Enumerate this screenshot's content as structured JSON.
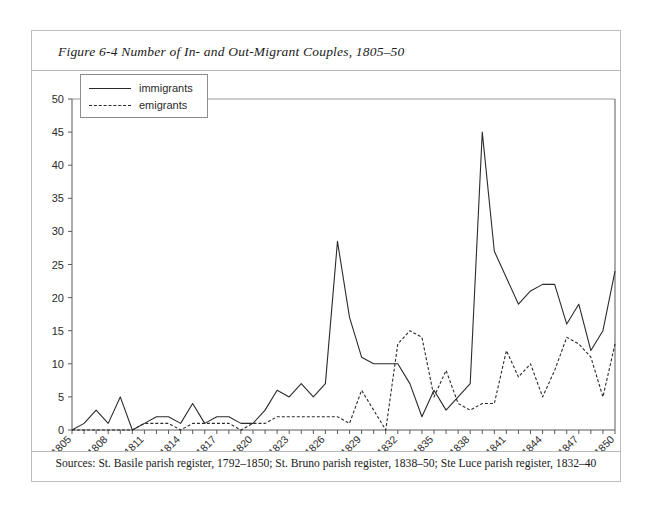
{
  "figure": {
    "title": "Figure 6-4 Number of In- and Out-Migrant Couples, 1805–50",
    "source_note": "Sources: St. Basile parish register, 1792–1850; St. Bruno parish register, 1838–50; Ste Luce parish register, 1832–40"
  },
  "legend": {
    "position": "top-left-inside",
    "entries": [
      {
        "label": "immigrants",
        "style": "solid"
      },
      {
        "label": "emigrants",
        "style": "dashed"
      }
    ]
  },
  "chart_data": {
    "type": "line",
    "title": "Figure 6-4 Number of In- and Out-Migrant Couples, 1805–50",
    "xlabel": "Year",
    "ylabel": "",
    "xlim": [
      1805,
      1850
    ],
    "ylim": [
      0,
      50
    ],
    "ytick_step": 5,
    "xtick_step": 3,
    "grid": false,
    "yticks": [
      0,
      5,
      10,
      15,
      20,
      25,
      30,
      35,
      40,
      45,
      50
    ],
    "ytick_labels": [
      "0",
      "5",
      "10",
      "15",
      "20",
      "25",
      "30",
      "35",
      "40",
      "45",
      "50"
    ],
    "xticks": [
      1805,
      1808,
      1811,
      1814,
      1817,
      1820,
      1823,
      1826,
      1829,
      1832,
      1835,
      1838,
      1841,
      1844,
      1847,
      1850
    ],
    "xtick_labels": [
      "1805",
      "1808",
      "1811",
      "1814",
      "1817",
      "1820",
      "1823",
      "1826",
      "1829",
      "1832",
      "1835",
      "1838",
      "1841",
      "1844",
      "1847",
      "1850"
    ],
    "x": [
      1805,
      1806,
      1807,
      1808,
      1809,
      1810,
      1811,
      1812,
      1813,
      1814,
      1815,
      1816,
      1817,
      1818,
      1819,
      1820,
      1821,
      1822,
      1823,
      1824,
      1825,
      1826,
      1827,
      1828,
      1829,
      1830,
      1831,
      1832,
      1833,
      1834,
      1835,
      1836,
      1837,
      1838,
      1839,
      1840,
      1841,
      1842,
      1843,
      1844,
      1845,
      1846,
      1847,
      1848,
      1849,
      1850
    ],
    "series": [
      {
        "name": "immigrants",
        "style": "solid",
        "values": [
          0,
          1,
          3,
          1,
          5,
          0,
          1,
          2,
          2,
          1,
          4,
          1,
          2,
          2,
          1,
          1,
          3,
          6,
          5,
          7,
          5,
          7,
          10,
          13,
          9,
          12,
          11,
          10,
          10,
          11,
          14,
          10,
          11,
          11,
          11,
          10,
          10,
          10,
          10,
          10,
          10,
          10,
          10,
          10,
          10,
          10
        ]
      },
      {
        "name": "emigrants",
        "style": "dashed",
        "values": [
          0,
          0,
          0,
          0,
          0,
          0,
          1,
          1,
          1,
          0,
          1,
          0,
          1,
          1,
          0,
          1,
          1,
          2,
          2,
          2,
          2,
          2,
          1,
          2,
          6,
          3,
          0,
          0,
          0,
          0,
          0,
          0,
          0,
          0,
          0,
          0,
          0,
          0,
          0,
          0,
          0,
          0,
          0,
          0,
          0,
          0
        ]
      }
    ],
    "series_points": {
      "immigrants": [
        [
          1805,
          0
        ],
        [
          1806,
          1
        ],
        [
          1807,
          3
        ],
        [
          1808,
          1
        ],
        [
          1809,
          5
        ],
        [
          1810,
          0
        ],
        [
          1811,
          1
        ],
        [
          1812,
          2
        ],
        [
          1813,
          2
        ],
        [
          1814,
          1
        ],
        [
          1815,
          4
        ],
        [
          1816,
          1
        ],
        [
          1817,
          2
        ],
        [
          1818,
          2
        ],
        [
          1819,
          1
        ],
        [
          1820,
          1
        ],
        [
          1821,
          3
        ],
        [
          1822,
          6
        ],
        [
          1823,
          5
        ],
        [
          1824,
          7
        ],
        [
          1825,
          5
        ],
        [
          1826,
          7
        ],
        [
          1827,
          28.5
        ],
        [
          1828,
          17
        ],
        [
          1829,
          11
        ],
        [
          1830,
          10
        ],
        [
          1831,
          10
        ],
        [
          1832,
          10
        ],
        [
          1833,
          7
        ],
        [
          1834,
          2
        ],
        [
          1835,
          6
        ],
        [
          1836,
          3
        ],
        [
          1837,
          5
        ],
        [
          1838,
          7
        ],
        [
          1839,
          45
        ],
        [
          1840,
          27
        ],
        [
          1841,
          23
        ],
        [
          1842,
          19
        ],
        [
          1843,
          21
        ],
        [
          1844,
          22
        ],
        [
          1845,
          22
        ],
        [
          1846,
          16
        ],
        [
          1847,
          19
        ],
        [
          1848,
          12
        ],
        [
          1849,
          15
        ],
        [
          1850,
          24
        ]
      ],
      "emigrants": [
        [
          1805,
          0
        ],
        [
          1806,
          0
        ],
        [
          1807,
          0
        ],
        [
          1808,
          0
        ],
        [
          1809,
          0
        ],
        [
          1810,
          0
        ],
        [
          1811,
          1
        ],
        [
          1812,
          1
        ],
        [
          1813,
          1
        ],
        [
          1814,
          0
        ],
        [
          1815,
          1
        ],
        [
          1816,
          1
        ],
        [
          1817,
          1
        ],
        [
          1818,
          1
        ],
        [
          1819,
          0
        ],
        [
          1820,
          1
        ],
        [
          1821,
          1
        ],
        [
          1822,
          2
        ],
        [
          1823,
          2
        ],
        [
          1824,
          2
        ],
        [
          1825,
          2
        ],
        [
          1826,
          2
        ],
        [
          1827,
          2
        ],
        [
          1828,
          1
        ],
        [
          1829,
          6
        ],
        [
          1830,
          3
        ],
        [
          1831,
          0
        ],
        [
          1832,
          13
        ],
        [
          1833,
          15
        ],
        [
          1834,
          14
        ],
        [
          1835,
          5
        ],
        [
          1836,
          9
        ],
        [
          1837,
          4
        ],
        [
          1838,
          3
        ],
        [
          1839,
          4
        ],
        [
          1840,
          4
        ],
        [
          1841,
          12
        ],
        [
          1842,
          8
        ],
        [
          1843,
          10
        ],
        [
          1844,
          5
        ],
        [
          1845,
          9
        ],
        [
          1846,
          14
        ],
        [
          1847,
          13
        ],
        [
          1848,
          11
        ],
        [
          1849,
          5
        ],
        [
          1850,
          13
        ]
      ]
    },
    "annotations": {
      "peak_immigrants": {
        "year": 1839,
        "value": 45
      },
      "secondary_peak_immigrants": {
        "year": 1827,
        "value": 28.5
      },
      "peak_emigrants": {
        "year": 1833,
        "value": 15
      }
    }
  }
}
